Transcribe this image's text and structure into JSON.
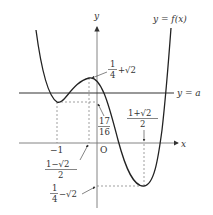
{
  "figure": {
    "curve_label": "y = f(x)",
    "line_label": "y = a",
    "axis_x_label": "x",
    "axis_y_label": "y",
    "origin_label": "O",
    "x_tick_neg1": "−1",
    "x_tick_left_crit": {
      "num": "1−√2",
      "den": "2"
    },
    "x_tick_right_crit": {
      "num": "1+√2",
      "den": "2"
    },
    "local_max_value": {
      "num": "1",
      "den": "4",
      "suffix": "+√2"
    },
    "local_min_left_value": {
      "num": "17",
      "den": "16"
    },
    "global_min_value": {
      "num": "1",
      "den": "4",
      "suffix": "−√2"
    }
  },
  "colors": {
    "curve": "#222222",
    "axis": "#666666",
    "dashed": "#777777",
    "text": "#333333"
  }
}
